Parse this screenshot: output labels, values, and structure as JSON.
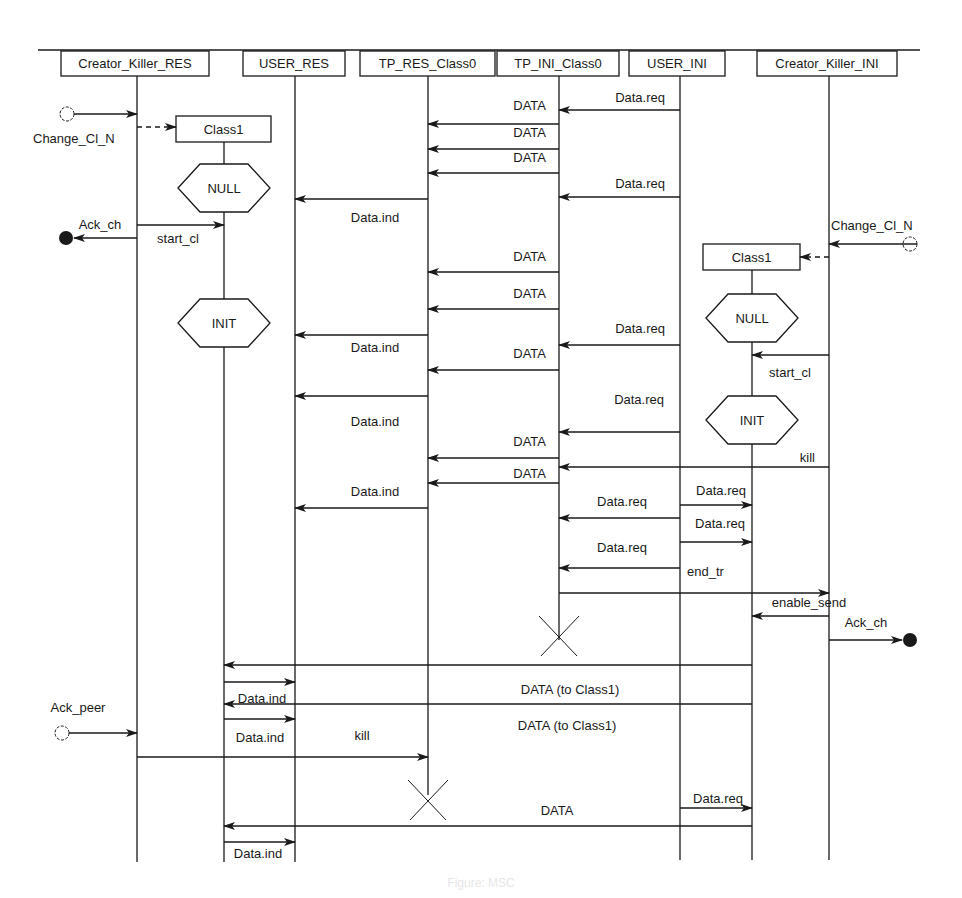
{
  "diagram": {
    "type": "MSC sequence diagram",
    "colors": {
      "ink": "#1a1a1a",
      "background": "#ffffff"
    },
    "top_rule": {
      "x1": 38,
      "x2": 920,
      "y": 50
    },
    "lifeline_bottom": 862,
    "instances": [
      {
        "id": "ck_res",
        "label": "Creator_Killer_RES",
        "x": 137,
        "box_x": 61,
        "box_w": 148,
        "end_y": 862
      },
      {
        "id": "user_res",
        "label": "USER_RES",
        "x": 295,
        "box_x": 243,
        "box_w": 102,
        "end_y": 862
      },
      {
        "id": "tp_res",
        "label": "TP_RES_Class0",
        "x": 428,
        "box_x": 360,
        "box_w": 135,
        "end_y": 795
      },
      {
        "id": "tp_ini",
        "label": "TP_INI_Class0",
        "x": 559,
        "box_x": 497,
        "box_w": 122,
        "end_y": 640
      },
      {
        "id": "user_ini",
        "label": "USER_INI",
        "x": 680,
        "box_x": 629,
        "box_w": 96,
        "end_y": 860
      },
      {
        "id": "ck_ini",
        "label": "Creator_Killer_INI",
        "x": 829,
        "box_x": 757,
        "box_w": 140,
        "end_y": 860
      }
    ],
    "created_instances": [
      {
        "id": "class1_res",
        "label": "Class1",
        "x": 224,
        "box_x": 176,
        "box_y": 116,
        "box_w": 95,
        "box_h": 26,
        "end_y": 862
      },
      {
        "id": "class1_ini",
        "label": "Class1",
        "x": 752,
        "box_x": 703,
        "box_y": 244,
        "box_w": 97,
        "box_h": 26,
        "end_y": 860
      }
    ],
    "states": [
      {
        "label": "NULL",
        "x": 224,
        "y": 188
      },
      {
        "label": "INIT",
        "x": 224,
        "y": 323
      },
      {
        "label": "NULL",
        "x": 752,
        "y": 318
      },
      {
        "label": "INIT",
        "x": 752,
        "y": 420
      }
    ],
    "stops": [
      {
        "x": 559,
        "y": 636
      },
      {
        "x": 428,
        "y": 800
      }
    ],
    "messages": [
      {
        "label": "Data.req",
        "from": 680,
        "to": 559,
        "y": 110,
        "lx": 665,
        "ly": 102,
        "anchor": "end"
      },
      {
        "label": "DATA",
        "from": 559,
        "to": 428,
        "y": 124,
        "lx": 546,
        "ly": 110,
        "anchor": "end"
      },
      {
        "label": "DATA",
        "from": 559,
        "to": 428,
        "y": 149,
        "lx": 546,
        "ly": 137,
        "anchor": "end"
      },
      {
        "label": "DATA",
        "from": 559,
        "to": 428,
        "y": 173,
        "lx": 546,
        "ly": 162,
        "anchor": "end"
      },
      {
        "label": "Data.req",
        "from": 680,
        "to": 559,
        "y": 197,
        "lx": 665,
        "ly": 188,
        "anchor": "end"
      },
      {
        "label": "Data.ind",
        "from": 428,
        "to": 295,
        "y": 199,
        "lx": 375,
        "ly": 222,
        "anchor": "middle"
      },
      {
        "label": "start_cl",
        "from": 137,
        "to": 224,
        "y": 225,
        "lx": 178,
        "ly": 243,
        "anchor": "middle"
      },
      {
        "label": "DATA",
        "from": 559,
        "to": 428,
        "y": 272,
        "lx": 546,
        "ly": 261,
        "anchor": "end"
      },
      {
        "label": "DATA",
        "from": 559,
        "to": 428,
        "y": 309,
        "lx": 546,
        "ly": 298,
        "anchor": "end"
      },
      {
        "label": "Data.req",
        "from": 680,
        "to": 559,
        "y": 345,
        "lx": 665,
        "ly": 333,
        "anchor": "end"
      },
      {
        "label": "Data.ind",
        "from": 428,
        "to": 295,
        "y": 335,
        "lx": 375,
        "ly": 352,
        "anchor": "middle"
      },
      {
        "label": "DATA",
        "from": 559,
        "to": 428,
        "y": 370,
        "lx": 546,
        "ly": 358,
        "anchor": "end"
      },
      {
        "label": "start_cl",
        "from": 829,
        "to": 752,
        "y": 355,
        "lx": 790,
        "ly": 377,
        "anchor": "middle"
      },
      {
        "label": "Data.ind",
        "from": 428,
        "to": 295,
        "y": 396,
        "lx": 375,
        "ly": 426,
        "anchor": "middle"
      },
      {
        "label": "Data.req",
        "from": 680,
        "to": 559,
        "y": 432,
        "lx": 664,
        "ly": 404,
        "anchor": "end"
      },
      {
        "label": "DATA",
        "from": 559,
        "to": 428,
        "y": 458,
        "lx": 546,
        "ly": 446,
        "anchor": "end"
      },
      {
        "label": "kill",
        "from": 829,
        "to": 559,
        "y": 467,
        "lx": 815,
        "ly": 462,
        "anchor": "end"
      },
      {
        "label": "DATA",
        "from": 559,
        "to": 428,
        "y": 483,
        "lx": 546,
        "ly": 478,
        "anchor": "end"
      },
      {
        "label": "Data.ind",
        "from": 428,
        "to": 295,
        "y": 508,
        "lx": 375,
        "ly": 496,
        "anchor": "middle"
      },
      {
        "label": "Data.req",
        "from": 680,
        "to": 752,
        "y": 505,
        "lx": 721,
        "ly": 495,
        "anchor": "middle"
      },
      {
        "label": "Data.req",
        "from": 680,
        "to": 559,
        "y": 518,
        "lx": 622,
        "ly": 506,
        "anchor": "middle"
      },
      {
        "label": "Data.req",
        "from": 680,
        "to": 752,
        "y": 542,
        "lx": 720,
        "ly": 528,
        "anchor": "middle"
      },
      {
        "label": "Data.req",
        "from": 680,
        "to": 559,
        "y": 568,
        "lx": 622,
        "ly": 552,
        "anchor": "middle"
      },
      {
        "label": "end_tr",
        "from": 680,
        "to": 680,
        "y": 0,
        "lx": 687,
        "ly": 576,
        "anchor": "start",
        "label_only": true
      },
      {
        "label": "",
        "from": 559,
        "to": 829,
        "y": 593,
        "lx": 0,
        "ly": 0,
        "anchor": "start"
      },
      {
        "label": "enable_send",
        "from": 829,
        "to": 752,
        "y": 616,
        "lx": 809,
        "ly": 607,
        "anchor": "middle"
      },
      {
        "label": "",
        "from": 752,
        "to": 224,
        "y": 665,
        "lx": 0,
        "ly": 0,
        "anchor": "start"
      },
      {
        "label": "",
        "from": 224,
        "to": 295,
        "y": 682,
        "lx": 0,
        "ly": 0,
        "anchor": "start"
      },
      {
        "label": "DATA    (to Class1)",
        "from": 752,
        "to": 752,
        "y": 0,
        "lx": 570,
        "ly": 694,
        "anchor": "middle",
        "label_only": true
      },
      {
        "label": "Data.ind",
        "from": 224,
        "to": 224,
        "y": 0,
        "lx": 262,
        "ly": 703,
        "anchor": "middle",
        "label_only": true
      },
      {
        "label": "",
        "from": 752,
        "to": 224,
        "y": 704,
        "lx": 0,
        "ly": 0,
        "anchor": "start"
      },
      {
        "label": "",
        "from": 224,
        "to": 295,
        "y": 719,
        "lx": 0,
        "ly": 0,
        "anchor": "start"
      },
      {
        "label": "DATA    (to Class1)",
        "from": 752,
        "to": 752,
        "y": 0,
        "lx": 567,
        "ly": 730,
        "anchor": "middle",
        "label_only": true
      },
      {
        "label": "Data.ind",
        "from": 224,
        "to": 224,
        "y": 0,
        "lx": 260,
        "ly": 742,
        "anchor": "middle",
        "label_only": true
      },
      {
        "label": "kill",
        "from": 137,
        "to": 428,
        "y": 757,
        "lx": 362,
        "ly": 740,
        "anchor": "middle"
      },
      {
        "label": "Data.req",
        "from": 680,
        "to": 752,
        "y": 808,
        "lx": 718,
        "ly": 803,
        "anchor": "middle"
      },
      {
        "label": "DATA",
        "from": 752,
        "to": 224,
        "y": 826,
        "lx": 557,
        "ly": 815,
        "anchor": "middle"
      },
      {
        "label": "",
        "from": 224,
        "to": 295,
        "y": 842,
        "lx": 0,
        "ly": 0,
        "anchor": "start"
      },
      {
        "label": "Data.ind",
        "from": 224,
        "to": 224,
        "y": 0,
        "lx": 258,
        "ly": 858,
        "anchor": "middle",
        "label_only": true
      }
    ],
    "creations": [
      {
        "from": 137,
        "to_box_x": 176,
        "y": 127
      },
      {
        "from": 829,
        "to_box_x": 800,
        "y": 257
      }
    ],
    "environment_gates": [
      {
        "kind": "input",
        "label": "Change_Cl_N",
        "circle_x": 67,
        "y": 114,
        "line_to": 137,
        "lx": 33,
        "ly": 143,
        "anchor": "start"
      },
      {
        "kind": "output",
        "label": "Ack_ch",
        "dot_x": 66,
        "y": 238,
        "line_from": 137,
        "lx": 100,
        "ly": 229,
        "anchor": "middle"
      },
      {
        "kind": "input",
        "label": "Change_Cl_N",
        "circle_x": 910,
        "y": 244,
        "line_to": 829,
        "lx": 831,
        "ly": 230,
        "anchor": "start"
      },
      {
        "kind": "output",
        "label": "Ack_ch",
        "dot_x": 910,
        "y": 640,
        "line_from": 829,
        "lx": 866,
        "ly": 627,
        "anchor": "middle"
      },
      {
        "kind": "input",
        "label": "Ack_peer",
        "circle_x": 62,
        "y": 733,
        "line_to": 137,
        "lx": 78,
        "ly": 712,
        "anchor": "middle"
      }
    ],
    "caption": "Figure: MSC"
  }
}
